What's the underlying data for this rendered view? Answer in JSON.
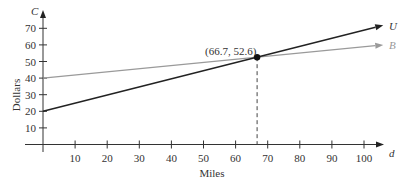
{
  "chart_data": {
    "type": "line",
    "title": "",
    "xlabel": "Miles",
    "ylabel": "Dollars",
    "x_axis_var": "d",
    "y_axis_var": "C",
    "xlim": [
      0,
      106
    ],
    "ylim": [
      0,
      73
    ],
    "x_ticks": [
      10,
      20,
      30,
      40,
      50,
      60,
      70,
      80,
      90,
      100
    ],
    "y_ticks": [
      10,
      20,
      30,
      40,
      50,
      60,
      70
    ],
    "grid": false,
    "series": [
      {
        "name": "U",
        "color": "#222222",
        "intercept": 20,
        "slope": 0.489,
        "points": [
          [
            0,
            20
          ],
          [
            66.7,
            52.6
          ],
          [
            106,
            71.8
          ]
        ]
      },
      {
        "name": "B",
        "color": "#999999",
        "intercept": 40,
        "slope": 0.189,
        "points": [
          [
            0,
            40
          ],
          [
            66.7,
            52.6
          ],
          [
            106,
            60.0
          ]
        ]
      }
    ],
    "annotations": [
      {
        "type": "point",
        "x": 66.7,
        "y": 52.6,
        "label": "(66.7, 52.6)"
      },
      {
        "type": "dashed-vertical",
        "x": 66.7,
        "from_y": 0,
        "to_y": 52.6
      }
    ]
  },
  "labels": {
    "y_var": "C",
    "x_var": "d",
    "ylabel": "Dollars",
    "xlabel": "Miles",
    "point": "(66.7, 52.6)",
    "series_u": "U",
    "series_b": "B"
  },
  "ticks": {
    "x": [
      "10",
      "20",
      "30",
      "40",
      "50",
      "60",
      "70",
      "80",
      "90",
      "100"
    ],
    "y": [
      "10",
      "20",
      "30",
      "40",
      "50",
      "60",
      "70"
    ]
  }
}
